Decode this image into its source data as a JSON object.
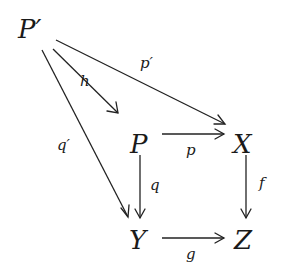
{
  "diagram": {
    "type": "commutative-diagram",
    "objects": [
      {
        "id": "Pprime",
        "label": "P′",
        "x": 33,
        "y": 38
      },
      {
        "id": "P",
        "label": "P",
        "x": 140,
        "y": 153
      },
      {
        "id": "X",
        "label": "X",
        "x": 244,
        "y": 153
      },
      {
        "id": "Y",
        "label": "Y",
        "x": 138,
        "y": 249
      },
      {
        "id": "Z",
        "label": "Z",
        "x": 244,
        "y": 249
      }
    ],
    "morphisms": [
      {
        "id": "h",
        "label": "h",
        "from": "Pprime",
        "to": "P"
      },
      {
        "id": "pprime",
        "label": "p′",
        "from": "Pprime",
        "to": "X"
      },
      {
        "id": "qprime",
        "label": "q′",
        "from": "Pprime",
        "to": "Y"
      },
      {
        "id": "p",
        "label": "p",
        "from": "P",
        "to": "X"
      },
      {
        "id": "q",
        "label": "q",
        "from": "P",
        "to": "Y"
      },
      {
        "id": "f",
        "label": "f",
        "from": "X",
        "to": "Z"
      },
      {
        "id": "g",
        "label": "g",
        "from": "Y",
        "to": "Z"
      }
    ]
  }
}
